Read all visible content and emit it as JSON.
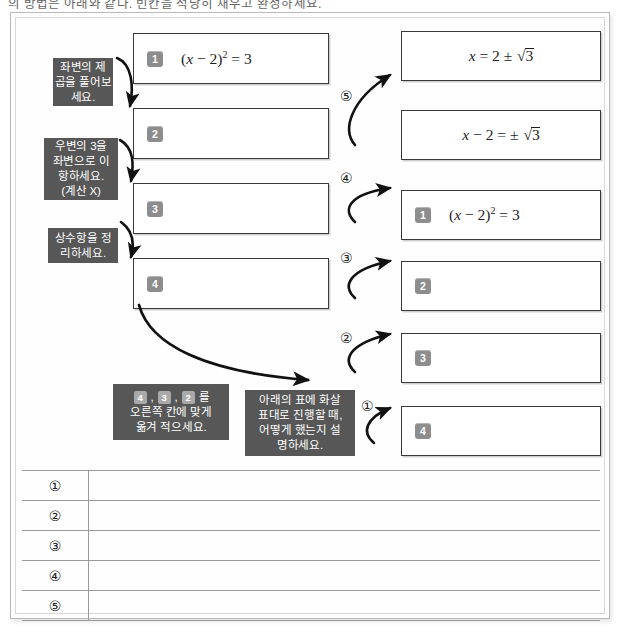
{
  "worksheet": {
    "top_instruction": "의 방법은 아래와 같다. 빈칸을 적당히 채우고 완성하세요.",
    "left_column": [
      {
        "badge": "1",
        "equation": "(x − 2)² = 3",
        "has_equation": true
      },
      {
        "badge": "2",
        "equation": "",
        "has_equation": false
      },
      {
        "badge": "3",
        "equation": "",
        "has_equation": false
      },
      {
        "badge": "4",
        "equation": "",
        "has_equation": false
      }
    ],
    "right_column": [
      {
        "badge": "",
        "equation": "x = 2 ± √3",
        "has_equation": true,
        "centered": true
      },
      {
        "badge": "",
        "equation": "x − 2 = ± √3",
        "has_equation": true,
        "centered": true
      },
      {
        "badge": "1",
        "equation": "(x − 2)² = 3",
        "has_equation": true,
        "centered": false
      },
      {
        "badge": "2",
        "equation": "",
        "has_equation": false,
        "centered": false
      },
      {
        "badge": "3",
        "equation": "",
        "has_equation": false,
        "centered": false
      },
      {
        "badge": "4",
        "equation": "",
        "has_equation": false,
        "centered": false
      }
    ],
    "notes": {
      "note1": {
        "lines": [
          "좌변의 제",
          "곱을 풀어보",
          "세요."
        ]
      },
      "note2": {
        "lines": [
          "우변의 3을",
          "좌변으로 이",
          "항하세요.",
          "(계산 X)"
        ]
      },
      "note3": {
        "lines": [
          "상수항을 정",
          "리하세요."
        ]
      },
      "note4": {
        "badges": [
          "4",
          "3",
          "2"
        ],
        "badge_suffix": "를",
        "lines": [
          "오른쪽 칸에 맞게",
          "옮겨 적으세요."
        ]
      },
      "note5": {
        "lines": [
          "아래의 표에 화살",
          "표대로 진행할 때,",
          "어떻게 했는지 설",
          "명하세요."
        ]
      }
    },
    "step_numbers": [
      "①",
      "②",
      "③",
      "④",
      "⑤"
    ],
    "table": {
      "rows": [
        {
          "num": "①",
          "answer": ""
        },
        {
          "num": "②",
          "answer": ""
        },
        {
          "num": "③",
          "answer": ""
        },
        {
          "num": "④",
          "answer": ""
        },
        {
          "num": "⑤",
          "answer": ""
        }
      ]
    },
    "colors": {
      "note_bg": "#575757",
      "badge_bg": "#8d8d8d",
      "box_border": "#3a3a3a",
      "rule": "#9a9a9a"
    }
  }
}
